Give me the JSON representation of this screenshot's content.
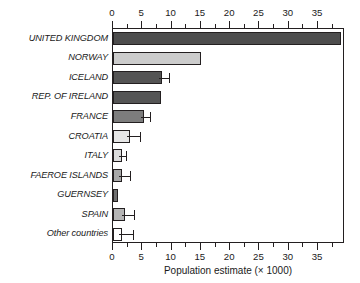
{
  "chart_data": {
    "type": "bar",
    "orientation": "horizontal",
    "title": "",
    "xlabel": "Population estimate (× 1000)",
    "ylabel": "",
    "xlim": [
      0,
      39.6
    ],
    "grid": false,
    "legend": null,
    "x_ticks": [
      0,
      5,
      10,
      15,
      20,
      25,
      30,
      35
    ],
    "x_tick_labels": [
      "0",
      "5",
      "10",
      "15",
      "20",
      "25",
      "30",
      "35"
    ],
    "x_minor_tick_step": 2.5,
    "axis_top": true,
    "axis_bottom": true,
    "categories": [
      "UNITED KINGDOM",
      "NORWAY",
      "ICELAND",
      "REP. OF IRELAND",
      "FRANCE",
      "CROATIA",
      "ITALY",
      "FAEROE ISLANDS",
      "GUERNSEY",
      "SPAIN",
      "Other countries"
    ],
    "values": [
      39.0,
      15.0,
      8.4,
      8.2,
      5.3,
      2.9,
      1.5,
      1.5,
      0.8,
      2.1,
      1.5
    ],
    "error_high": [
      null,
      null,
      9.6,
      null,
      6.3,
      4.6,
      2.2,
      2.9,
      null,
      3.6,
      3.4
    ],
    "bar_colors": [
      "#4d4d4d",
      "#cccccc",
      "#545454",
      "#555555",
      "#7d7d7d",
      "#e6e6e6",
      "#dcdcdc",
      "#a8a8a8",
      "#707070",
      "#b5b5b5",
      "#ffffff"
    ],
    "bar_edge_color": "#231f20",
    "background_color": "#ffffff"
  }
}
